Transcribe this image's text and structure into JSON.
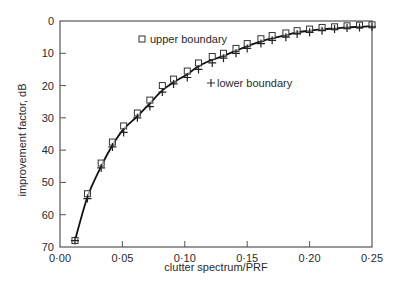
{
  "chart_data": {
    "type": "line",
    "title": "",
    "xlabel": "clutter spectrum/PRF",
    "ylabel": "improvement factor, dB",
    "xlim": [
      0.0,
      0.25
    ],
    "ylim": [
      70,
      0
    ],
    "y_inverted": true,
    "grid": false,
    "x_ticks": [
      "0·00",
      "0·05",
      "0·10",
      "0·15",
      "0·20",
      "0·25"
    ],
    "x_tick_values": [
      0.0,
      0.05,
      0.1,
      0.15,
      0.2,
      0.25
    ],
    "y_ticks": [
      "0",
      "10",
      "20",
      "30",
      "40",
      "50",
      "60",
      "70"
    ],
    "y_tick_values": [
      0,
      10,
      20,
      30,
      40,
      50,
      60,
      70
    ],
    "legend": [
      {
        "marker": "square",
        "label": "upper boundary"
      },
      {
        "marker": "plus",
        "label": "lower boundary"
      }
    ],
    "series": [
      {
        "name": "upper boundary",
        "marker": "square",
        "x": [
          0.012,
          0.022,
          0.033,
          0.042,
          0.051,
          0.062,
          0.072,
          0.082,
          0.091,
          0.102,
          0.111,
          0.122,
          0.131,
          0.141,
          0.15,
          0.161,
          0.17,
          0.181,
          0.19,
          0.2,
          0.21,
          0.22,
          0.23,
          0.24,
          0.25
        ],
        "y": [
          68,
          53.5,
          44,
          37.5,
          32.5,
          28.5,
          24.5,
          20,
          18,
          15.5,
          13,
          11,
          10,
          8.5,
          7,
          5.5,
          4.5,
          3.7,
          3,
          2.5,
          2,
          1.8,
          1.5,
          1.3,
          1.2
        ]
      },
      {
        "name": "lower boundary",
        "marker": "plus",
        "x": [
          0.012,
          0.022,
          0.033,
          0.042,
          0.051,
          0.062,
          0.072,
          0.082,
          0.091,
          0.102,
          0.111,
          0.122,
          0.131,
          0.141,
          0.15,
          0.161,
          0.17,
          0.181,
          0.19,
          0.2,
          0.21,
          0.22,
          0.23,
          0.24,
          0.25
        ],
        "y": [
          68,
          55,
          45.5,
          39,
          34.5,
          30,
          26.5,
          22,
          19.5,
          17.5,
          15,
          13,
          11.5,
          10,
          8.5,
          7,
          6,
          5,
          4,
          3.5,
          3,
          2.5,
          2.2,
          2,
          1.8
        ]
      },
      {
        "name": "fitted curve",
        "marker": "none",
        "x": [
          0.012,
          0.022,
          0.033,
          0.042,
          0.051,
          0.062,
          0.072,
          0.082,
          0.091,
          0.102,
          0.111,
          0.122,
          0.131,
          0.141,
          0.15,
          0.161,
          0.17,
          0.181,
          0.19,
          0.2,
          0.21,
          0.22,
          0.23,
          0.24,
          0.25
        ],
        "y": [
          68,
          54.5,
          45,
          38.5,
          33.5,
          29.5,
          25.5,
          21.5,
          19,
          16.5,
          14,
          12,
          10.8,
          9.2,
          7.8,
          6.3,
          5.3,
          4.4,
          3.5,
          3,
          2.6,
          2.3,
          2,
          1.8,
          1.6
        ]
      }
    ]
  }
}
